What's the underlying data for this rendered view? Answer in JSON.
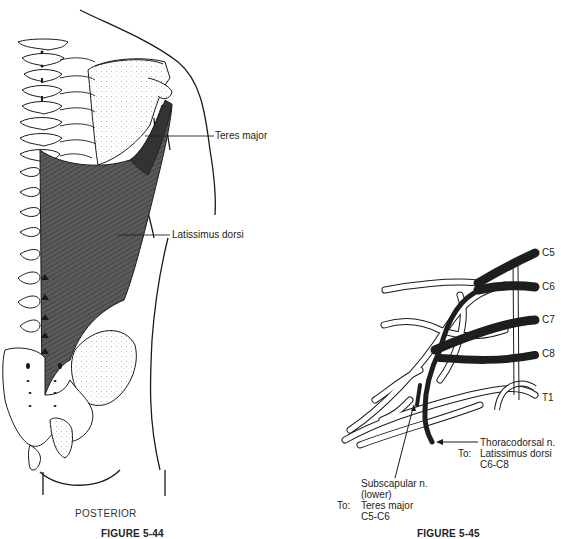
{
  "figure_44": {
    "caption": "FIGURE 5-44",
    "view_label": "POSTERIOR",
    "labels": {
      "teres_major": "Teres major",
      "latissimus_dorsi": "Latissimus dorsi"
    }
  },
  "figure_45": {
    "caption": "FIGURE 5-45",
    "roots": [
      "C5",
      "C6",
      "C7",
      "C8",
      "T1"
    ],
    "thoracodorsal": {
      "name": "Thoracodorsal n.",
      "to_prefix": "To:",
      "target": "Latissimus dorsi",
      "roots": "C6-C8"
    },
    "subscapular": {
      "name": "Subscapular n.",
      "qualifier": "(lower)",
      "to_prefix": "To:",
      "target": "Teres major",
      "roots": "C5-C6"
    }
  },
  "colors": {
    "muscle": "#4a4a4a",
    "nerve_highlight": "#2a2a2a",
    "outline": "#1a1a1a"
  }
}
